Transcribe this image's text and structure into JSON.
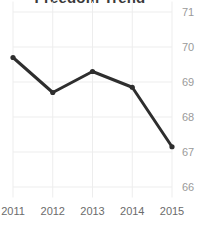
{
  "chart_data": {
    "type": "line",
    "title": "Freedom Trend",
    "xlabel": "",
    "ylabel": "",
    "categories": [
      "2011",
      "2012",
      "2013",
      "2014",
      "2015"
    ],
    "x": [
      2011,
      2012,
      2013,
      2014,
      2015
    ],
    "values": [
      69.7,
      68.7,
      69.3,
      68.85,
      67.15
    ],
    "series": [
      {
        "name": "Freedom Score",
        "values": [
          69.7,
          68.7,
          69.3,
          68.85,
          67.15
        ]
      }
    ],
    "ylim": [
      65.7,
      71.3
    ],
    "yticks": [
      66,
      67,
      68,
      69,
      70,
      71
    ],
    "ytick_labels": [
      "66",
      "67",
      "68",
      "69",
      "70",
      "71"
    ],
    "xticks": [
      2011,
      2012,
      2013,
      2014,
      2015
    ],
    "xtick_labels": [
      "2011",
      "2012",
      "2013",
      "2014",
      "2015"
    ],
    "grid": true,
    "grid_color": "#ededed",
    "legend": false,
    "legend_position": "none",
    "line_color": "#2e2e2e",
    "marker": "circle",
    "marker_color": "#2e2e2e",
    "y_axis_side": "right",
    "background_color": "#ffffff",
    "title_color": "#3a3a3a",
    "ytick_color": "#9a9a9a",
    "xtick_color": "#6b6b6b"
  }
}
